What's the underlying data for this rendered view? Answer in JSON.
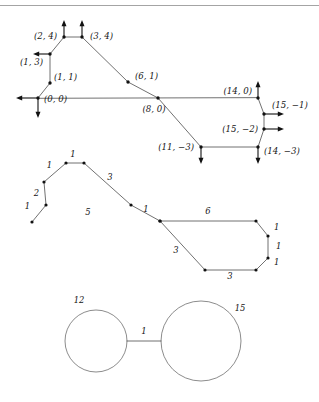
{
  "page": {
    "width": 319,
    "height": 402,
    "background_color": "#ffffff",
    "ink_color": "#1a1a1a",
    "edge_color": "#4c4c4c",
    "rule_color": "#9a9a9a",
    "has_top_rule": true
  },
  "figures": [
    {
      "id": "figure-1",
      "name": "coordinate-polygon-with-normal-arrows",
      "type": "polygon",
      "description": "Closed polygonal chain with integer lattice coordinate labels at each vertex and outward arrows at extreme vertices",
      "vertices": [
        {
          "label": "(0,0)",
          "text": "(0, 0)",
          "x": 0,
          "y": 0,
          "px": 38,
          "py": 98,
          "label_dx": 6,
          "label_dy": 4,
          "anchor": "start"
        },
        {
          "label": "(1,1)",
          "text": "(1, 1)",
          "x": 1,
          "y": 1,
          "px": 50,
          "py": 83,
          "label_dx": 4,
          "label_dy": -3,
          "anchor": "start"
        },
        {
          "label": "(1,3)",
          "text": "(1, 3)",
          "x": 1,
          "y": 3,
          "px": 50,
          "py": 54,
          "label_dx": -7,
          "label_dy": 11,
          "anchor": "end"
        },
        {
          "label": "(2,4)",
          "text": "(2, 4)",
          "x": 2,
          "y": 4,
          "px": 64,
          "py": 37,
          "label_dx": -7,
          "label_dy": 2,
          "anchor": "end"
        },
        {
          "label": "(3,4)",
          "text": "(3, 4)",
          "x": 3,
          "y": 4,
          "px": 82,
          "py": 37,
          "label_dx": 8,
          "label_dy": 2,
          "anchor": "start"
        },
        {
          "label": "(6,1)",
          "text": "(6, 1)",
          "x": 6,
          "y": 1,
          "px": 128,
          "py": 82,
          "label_dx": 7,
          "label_dy": -3,
          "anchor": "start"
        },
        {
          "label": "(8,0)",
          "text": "(8, 0)",
          "x": 8,
          "y": 0,
          "px": 158,
          "py": 98,
          "label_dx": -4,
          "label_dy": 14,
          "anchor": "middle"
        },
        {
          "label": "(11,-3)",
          "text": "(11, −3)",
          "x": 11,
          "y": -3,
          "px": 201,
          "py": 147,
          "label_dx": -7,
          "label_dy": 3,
          "anchor": "end"
        },
        {
          "label": "(14,-3)",
          "text": "(14, −3)",
          "x": 14,
          "y": -3,
          "px": 258,
          "py": 147,
          "label_dx": 6,
          "label_dy": 7,
          "anchor": "start"
        },
        {
          "label": "(15,-2)",
          "text": "(15, −2)",
          "x": 15,
          "y": -2,
          "px": 264,
          "py": 129,
          "label_dx": -6,
          "label_dy": 3,
          "anchor": "end"
        },
        {
          "label": "(15,-1)",
          "text": "(15, −1)",
          "x": 15,
          "y": -1,
          "px": 264,
          "py": 114,
          "label_dx": 8,
          "label_dy": -6,
          "anchor": "start"
        },
        {
          "label": "(14,0)",
          "text": "(14, 0)",
          "x": 14,
          "y": 0,
          "px": 258,
          "py": 98,
          "label_dx": -6,
          "label_dy": -4,
          "anchor": "end"
        }
      ],
      "arrows": [
        {
          "at": "(2,4)",
          "direction": "up",
          "px": 64,
          "py": 37,
          "dx": 0,
          "dy": -17
        },
        {
          "at": "(3,4)",
          "direction": "up",
          "px": 82,
          "py": 37,
          "dx": 0,
          "dy": -17
        },
        {
          "at": "(1,3)",
          "direction": "left",
          "px": 50,
          "py": 54,
          "dx": -17,
          "dy": 0
        },
        {
          "at": "(0,0)",
          "direction": "left",
          "px": 38,
          "py": 98,
          "dx": -22,
          "dy": 0
        },
        {
          "at": "(0,0)",
          "direction": "down",
          "px": 38,
          "py": 98,
          "dx": 0,
          "dy": 20
        },
        {
          "at": "(14,0)",
          "direction": "up",
          "px": 258,
          "py": 98,
          "dx": 0,
          "dy": -17
        },
        {
          "at": "(15,-1)",
          "direction": "right",
          "px": 264,
          "py": 114,
          "dx": 20,
          "dy": 0
        },
        {
          "at": "(15,-2)",
          "direction": "right",
          "px": 264,
          "py": 129,
          "dx": 20,
          "dy": 0
        },
        {
          "at": "(11,-3)",
          "direction": "down",
          "px": 201,
          "py": 147,
          "dx": 0,
          "dy": 17
        },
        {
          "at": "(14,-3)",
          "direction": "down",
          "px": 258,
          "py": 147,
          "dx": 0,
          "dy": 17
        }
      ]
    },
    {
      "id": "figure-2",
      "name": "edge-length-labeled-polyline",
      "type": "polyline",
      "description": "Open polygonal chain whose edges carry integer length labels",
      "points_px": [
        {
          "px": 32,
          "py": 222
        },
        {
          "px": 46,
          "py": 205
        },
        {
          "px": 44,
          "py": 182
        },
        {
          "px": 66,
          "py": 163
        },
        {
          "px": 84,
          "py": 163
        },
        {
          "px": 131,
          "py": 205
        },
        {
          "px": 160,
          "py": 221
        },
        {
          "px": 256,
          "py": 221
        },
        {
          "px": 268,
          "py": 236
        },
        {
          "px": 268,
          "py": 258
        },
        {
          "px": 256,
          "py": 270
        },
        {
          "px": 205,
          "py": 270
        },
        {
          "px": 160,
          "py": 221
        }
      ],
      "edge_labels": [
        {
          "value": "1",
          "px": 30,
          "py": 209,
          "anchor": "end"
        },
        {
          "value": "2",
          "px": 39,
          "py": 196,
          "anchor": "end"
        },
        {
          "value": "1",
          "px": 52,
          "py": 168,
          "anchor": "end"
        },
        {
          "value": "1",
          "px": 73,
          "py": 157,
          "anchor": "middle"
        },
        {
          "value": "3",
          "px": 110,
          "py": 180,
          "anchor": "middle"
        },
        {
          "value": "5",
          "px": 88,
          "py": 215,
          "anchor": "middle"
        },
        {
          "value": "1",
          "px": 146,
          "py": 212,
          "anchor": "middle"
        },
        {
          "value": "6",
          "px": 208,
          "py": 214,
          "anchor": "middle"
        },
        {
          "value": "1",
          "px": 274,
          "py": 230,
          "anchor": "start"
        },
        {
          "value": "1",
          "px": 276,
          "py": 249,
          "anchor": "start"
        },
        {
          "value": "1",
          "px": 274,
          "py": 265,
          "anchor": "start"
        },
        {
          "value": "3",
          "px": 230,
          "py": 279,
          "anchor": "middle"
        },
        {
          "value": "3",
          "px": 176,
          "py": 253,
          "anchor": "middle"
        }
      ]
    },
    {
      "id": "figure-3",
      "name": "two-circles-joined-by-segment",
      "type": "circles",
      "description": "Two circles of different radii connected by a short horizontal segment; circles and segment carry numeric labels",
      "circles": [
        {
          "label": "12",
          "cx": 96,
          "cy": 341,
          "r": 31,
          "label_px": 79,
          "label_py": 303,
          "anchor": "middle"
        },
        {
          "label": "15",
          "cx": 201,
          "cy": 341,
          "r": 40,
          "label_px": 240,
          "label_py": 311,
          "anchor": "middle"
        }
      ],
      "connector": {
        "label": "1",
        "x1": 127,
        "y1": 341,
        "x2": 161,
        "y2": 341,
        "label_px": 144,
        "label_py": 334,
        "anchor": "middle"
      }
    }
  ]
}
